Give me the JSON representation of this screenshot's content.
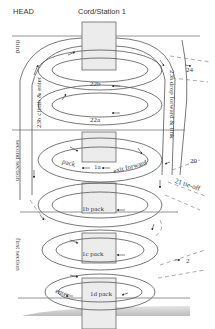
{
  "header": {
    "left": "HEAD",
    "center": "Cord/Station 1"
  },
  "sections": {
    "third": "third",
    "second": "second section",
    "first": "first section"
  },
  "steps": {
    "s22b": "22b",
    "s22a": "22a",
    "s1a_pack": "pack",
    "s1a": "1a",
    "s1a_exit": "exit forward",
    "s1b": "1b  pack",
    "s1c": "1c  pack",
    "s1d": "1d  pack",
    "s1d_enter": "enter",
    "s23a": "23a  drop forward & link",
    "s23b": "23b  climb & enter",
    "s24": "24",
    "s20": "20",
    "s21": "21  tie-off",
    "s2": "2"
  },
  "colors": {
    "line": "#555555",
    "cord_fill": "#ececec",
    "dash": "#888888",
    "text": "#3a3a3a"
  }
}
